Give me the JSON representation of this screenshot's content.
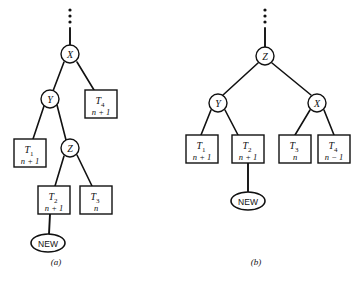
{
  "figure": {
    "width": 360,
    "height": 284,
    "ink_color": "#111111",
    "background_color": "#ffffff"
  },
  "panels": [
    {
      "id": "a",
      "caption": "(a)",
      "nodes": {
        "x": "X",
        "y": "Y",
        "z": "Z",
        "new": "NEW"
      },
      "subtrees": [
        {
          "name": "T",
          "index": "1",
          "height": "n + 1"
        },
        {
          "name": "T",
          "index": "2",
          "height": "n + 1"
        },
        {
          "name": "T",
          "index": "3",
          "height": "n"
        },
        {
          "name": "T",
          "index": "4",
          "height": "n + 1"
        }
      ]
    },
    {
      "id": "b",
      "caption": "(b)",
      "nodes": {
        "z": "Z",
        "y": "Y",
        "x": "X",
        "new": "NEW"
      },
      "subtrees": [
        {
          "name": "T",
          "index": "1",
          "height": "n + 1"
        },
        {
          "name": "T",
          "index": "2",
          "height": "n + 1"
        },
        {
          "name": "T",
          "index": "3",
          "height": "n"
        },
        {
          "name": "T",
          "index": "4",
          "height": "n − 1"
        }
      ]
    }
  ]
}
